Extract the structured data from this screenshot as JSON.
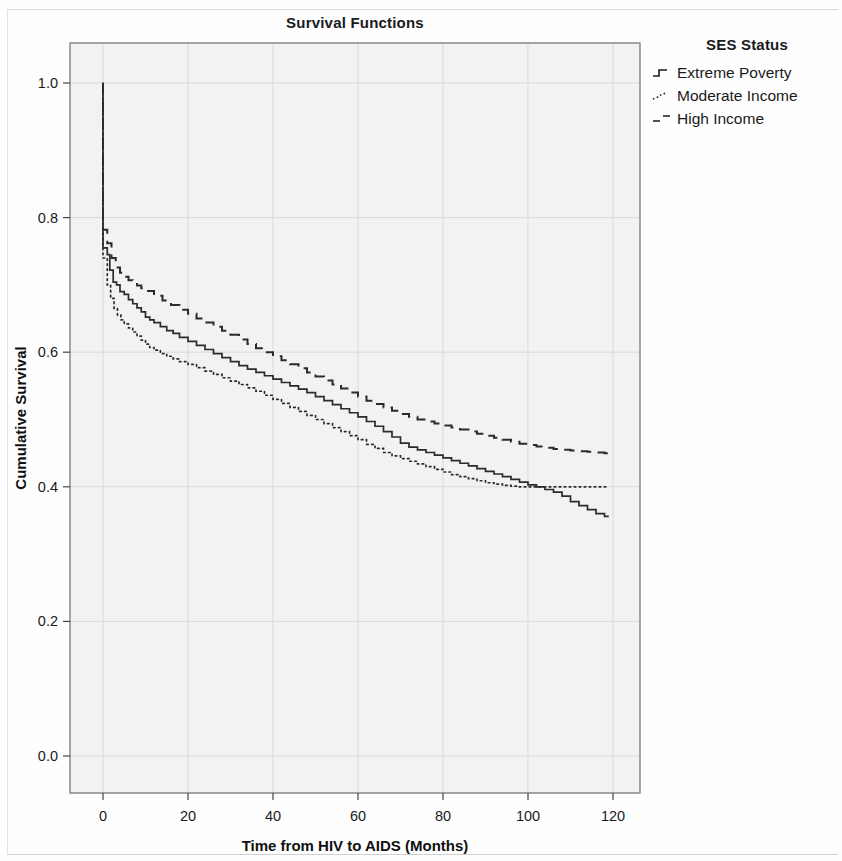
{
  "chart_data": {
    "type": "line",
    "title": "Survival Functions",
    "xlabel": "Time from HIV to AIDS (Months)",
    "ylabel": "Cumulative Survival",
    "xlim": [
      -8,
      128
    ],
    "ylim": [
      0.0,
      1.05
    ],
    "xticks": [
      0,
      20,
      40,
      60,
      80,
      100,
      120
    ],
    "yticks": [
      "0.0",
      "0.2",
      "0.4",
      "0.6",
      "0.8",
      "1.0"
    ],
    "ytick_values": [
      0.0,
      0.2,
      0.4,
      0.6,
      0.8,
      1.0
    ],
    "grid": true,
    "legend_title": "SES Status",
    "legend_position": "right",
    "plot_background": "#f2f2f2",
    "axis_color": "#7a7a7a",
    "grid_color": "#d9d9d9",
    "line_color": "#2b2b2b",
    "series": [
      {
        "name": "Extreme Poverty",
        "style": "solid",
        "key_glyph": "step-solid",
        "points": [
          [
            0,
            1.0
          ],
          [
            0,
            0.755
          ],
          [
            1,
            0.745
          ],
          [
            1.6,
            0.722
          ],
          [
            2.4,
            0.704
          ],
          [
            3.2,
            0.7
          ],
          [
            4,
            0.69
          ],
          [
            5,
            0.686
          ],
          [
            6,
            0.678
          ],
          [
            7,
            0.672
          ],
          [
            8,
            0.666
          ],
          [
            9,
            0.66
          ],
          [
            10,
            0.652
          ],
          [
            11,
            0.648
          ],
          [
            12,
            0.644
          ],
          [
            13.5,
            0.638
          ],
          [
            15,
            0.632
          ],
          [
            16.5,
            0.628
          ],
          [
            18,
            0.622
          ],
          [
            20,
            0.616
          ],
          [
            22,
            0.61
          ],
          [
            24,
            0.604
          ],
          [
            26,
            0.598
          ],
          [
            28,
            0.592
          ],
          [
            30,
            0.586
          ],
          [
            32,
            0.58
          ],
          [
            34,
            0.575
          ],
          [
            36,
            0.57
          ],
          [
            38,
            0.565
          ],
          [
            40,
            0.56
          ],
          [
            42,
            0.555
          ],
          [
            44,
            0.55
          ],
          [
            46,
            0.545
          ],
          [
            48,
            0.54
          ],
          [
            50,
            0.534
          ],
          [
            52,
            0.528
          ],
          [
            54,
            0.522
          ],
          [
            56,
            0.516
          ],
          [
            58,
            0.51
          ],
          [
            60,
            0.504
          ],
          [
            62,
            0.497
          ],
          [
            64,
            0.49
          ],
          [
            66,
            0.482
          ],
          [
            68,
            0.474
          ],
          [
            70,
            0.465
          ],
          [
            72,
            0.459
          ],
          [
            74,
            0.455
          ],
          [
            76,
            0.451
          ],
          [
            78,
            0.447
          ],
          [
            80,
            0.443
          ],
          [
            82,
            0.439
          ],
          [
            84,
            0.435
          ],
          [
            86,
            0.431
          ],
          [
            88,
            0.427
          ],
          [
            90,
            0.423
          ],
          [
            92,
            0.419
          ],
          [
            94,
            0.415
          ],
          [
            96,
            0.411
          ],
          [
            98,
            0.407
          ],
          [
            100,
            0.403
          ],
          [
            102,
            0.4
          ],
          [
            104,
            0.396
          ],
          [
            106,
            0.392
          ],
          [
            108,
            0.386
          ],
          [
            110,
            0.378
          ],
          [
            112,
            0.372
          ],
          [
            114,
            0.366
          ],
          [
            116,
            0.36
          ],
          [
            118,
            0.356
          ],
          [
            119,
            0.356
          ]
        ]
      },
      {
        "name": "Moderate Income",
        "style": "dotted",
        "key_glyph": "step-dotted",
        "points": [
          [
            0,
            1.0
          ],
          [
            0,
            0.74
          ],
          [
            1,
            0.7
          ],
          [
            1.8,
            0.68
          ],
          [
            2.6,
            0.665
          ],
          [
            3.4,
            0.655
          ],
          [
            4.2,
            0.648
          ],
          [
            5,
            0.642
          ],
          [
            6,
            0.636
          ],
          [
            7,
            0.63
          ],
          [
            8,
            0.624
          ],
          [
            9,
            0.618
          ],
          [
            10,
            0.612
          ],
          [
            11,
            0.607
          ],
          [
            12,
            0.603
          ],
          [
            13.5,
            0.598
          ],
          [
            15,
            0.594
          ],
          [
            16.5,
            0.59
          ],
          [
            18,
            0.586
          ],
          [
            20,
            0.582
          ],
          [
            22,
            0.577
          ],
          [
            24,
            0.572
          ],
          [
            26,
            0.567
          ],
          [
            28,
            0.562
          ],
          [
            30,
            0.557
          ],
          [
            32,
            0.552
          ],
          [
            34,
            0.547
          ],
          [
            36,
            0.542
          ],
          [
            38,
            0.536
          ],
          [
            40,
            0.53
          ],
          [
            42,
            0.524
          ],
          [
            44,
            0.518
          ],
          [
            46,
            0.512
          ],
          [
            48,
            0.506
          ],
          [
            50,
            0.5
          ],
          [
            52,
            0.494
          ],
          [
            54,
            0.488
          ],
          [
            56,
            0.482
          ],
          [
            58,
            0.476
          ],
          [
            60,
            0.47
          ],
          [
            62,
            0.463
          ],
          [
            64,
            0.457
          ],
          [
            66,
            0.451
          ],
          [
            68,
            0.446
          ],
          [
            70,
            0.442
          ],
          [
            72,
            0.438
          ],
          [
            74,
            0.434
          ],
          [
            76,
            0.43
          ],
          [
            78,
            0.426
          ],
          [
            80,
            0.422
          ],
          [
            82,
            0.418
          ],
          [
            84,
            0.415
          ],
          [
            86,
            0.412
          ],
          [
            88,
            0.409
          ],
          [
            90,
            0.406
          ],
          [
            92,
            0.404
          ],
          [
            94,
            0.402
          ],
          [
            96,
            0.401
          ],
          [
            98,
            0.4
          ],
          [
            100,
            0.4
          ],
          [
            105,
            0.4
          ],
          [
            110,
            0.4
          ],
          [
            115,
            0.4
          ],
          [
            119,
            0.4
          ]
        ]
      },
      {
        "name": "High Income",
        "style": "dashed",
        "key_glyph": "step-dashed",
        "points": [
          [
            0,
            1.0
          ],
          [
            0,
            0.782
          ],
          [
            1,
            0.762
          ],
          [
            2,
            0.74
          ],
          [
            3,
            0.726
          ],
          [
            4,
            0.718
          ],
          [
            5,
            0.712
          ],
          [
            6,
            0.707
          ],
          [
            7,
            0.703
          ],
          [
            8,
            0.699
          ],
          [
            9,
            0.695
          ],
          [
            10,
            0.691
          ],
          [
            12,
            0.684
          ],
          [
            14,
            0.677
          ],
          [
            16,
            0.67
          ],
          [
            18,
            0.663
          ],
          [
            20,
            0.657
          ],
          [
            22,
            0.65
          ],
          [
            24,
            0.644
          ],
          [
            26,
            0.638
          ],
          [
            28,
            0.632
          ],
          [
            30,
            0.626
          ],
          [
            32,
            0.619
          ],
          [
            34,
            0.612
          ],
          [
            36,
            0.606
          ],
          [
            38,
            0.6
          ],
          [
            40,
            0.594
          ],
          [
            42,
            0.588
          ],
          [
            44,
            0.582
          ],
          [
            46,
            0.576
          ],
          [
            48,
            0.57
          ],
          [
            50,
            0.564
          ],
          [
            52,
            0.558
          ],
          [
            54,
            0.552
          ],
          [
            56,
            0.546
          ],
          [
            58,
            0.54
          ],
          [
            60,
            0.534
          ],
          [
            62,
            0.528
          ],
          [
            64,
            0.523
          ],
          [
            66,
            0.518
          ],
          [
            68,
            0.513
          ],
          [
            70,
            0.508
          ],
          [
            72,
            0.504
          ],
          [
            74,
            0.5
          ],
          [
            76,
            0.497
          ],
          [
            78,
            0.494
          ],
          [
            80,
            0.491
          ],
          [
            82,
            0.488
          ],
          [
            84,
            0.485
          ],
          [
            86,
            0.482
          ],
          [
            88,
            0.479
          ],
          [
            90,
            0.476
          ],
          [
            92,
            0.473
          ],
          [
            94,
            0.47
          ],
          [
            96,
            0.467
          ],
          [
            98,
            0.464
          ],
          [
            100,
            0.462
          ],
          [
            102,
            0.46
          ],
          [
            104,
            0.458
          ],
          [
            106,
            0.456
          ],
          [
            108,
            0.455
          ],
          [
            110,
            0.454
          ],
          [
            112,
            0.453
          ],
          [
            114,
            0.452
          ],
          [
            116,
            0.451
          ],
          [
            118,
            0.45
          ],
          [
            119,
            0.45
          ]
        ]
      }
    ]
  },
  "legend": {
    "title": "SES Status",
    "items": [
      {
        "label": "Extreme Poverty",
        "style": "solid"
      },
      {
        "label": "Moderate Income",
        "style": "dotted"
      },
      {
        "label": "High Income",
        "style": "dashed"
      }
    ]
  }
}
